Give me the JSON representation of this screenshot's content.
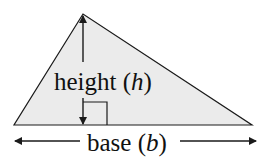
{
  "diagram": {
    "type": "triangle-area",
    "labels": {
      "height_word": "height (",
      "height_var": "h",
      "height_close": ")",
      "base_word": "base (",
      "base_var": "b",
      "base_close": ")"
    },
    "colors": {
      "fill": "#ebebeb",
      "stroke": "#1a1a1a",
      "background": "#ffffff"
    }
  }
}
